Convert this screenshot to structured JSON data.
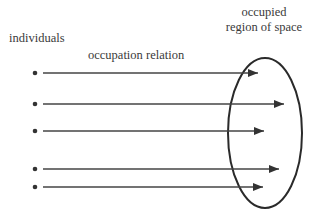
{
  "labels": {
    "individuals": "individuals",
    "relation": "occupation relation",
    "region_line1": "occupied",
    "region_line2": "region of space"
  },
  "arrows": [
    {
      "y": 73,
      "tip_x": 258
    },
    {
      "y": 104,
      "tip_x": 284
    },
    {
      "y": 131,
      "tip_x": 264
    },
    {
      "y": 169,
      "tip_x": 279
    },
    {
      "y": 187,
      "tip_x": 263
    }
  ],
  "colors": {
    "stroke": "#333333",
    "text": "#3a3a3a"
  }
}
